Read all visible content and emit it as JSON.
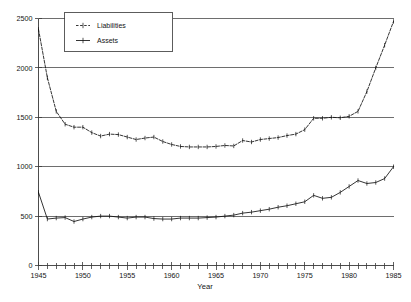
{
  "chart_data": {
    "type": "line",
    "title": "",
    "xlabel": "Year",
    "ylabel": "",
    "xlim": [
      1945,
      1985
    ],
    "ylim": [
      0,
      2500
    ],
    "grid": true,
    "grid_axis": "y",
    "legend_position": "top-left",
    "x_tick_labels": [
      "1945",
      "1950",
      "1955",
      "1960",
      "1965",
      "1970",
      "1975",
      "1980",
      "1985"
    ],
    "x_tick_values": [
      1945,
      1950,
      1955,
      1960,
      1965,
      1970,
      1975,
      1980,
      1985
    ],
    "x_minor_ticks_every": 1,
    "y_tick_labels": [
      "0",
      "500",
      "1000",
      "1500",
      "2000",
      "2500"
    ],
    "y_tick_values": [
      0,
      500,
      1000,
      1500,
      2000,
      2500
    ],
    "x": [
      1945,
      1946,
      1947,
      1948,
      1949,
      1950,
      1951,
      1952,
      1953,
      1954,
      1955,
      1956,
      1957,
      1958,
      1959,
      1960,
      1961,
      1962,
      1963,
      1964,
      1965,
      1966,
      1967,
      1968,
      1969,
      1970,
      1971,
      1972,
      1973,
      1974,
      1975,
      1976,
      1977,
      1978,
      1979,
      1980,
      1981,
      1982,
      1983,
      1984,
      1985
    ],
    "series": [
      {
        "name": "Liabilities",
        "style": "dashed",
        "marker": "plus",
        "color": "#111111",
        "values": [
          2390,
          1900,
          1560,
          1430,
          1400,
          1400,
          1345,
          1310,
          1330,
          1325,
          1300,
          1275,
          1290,
          1300,
          1255,
          1225,
          1205,
          1200,
          1200,
          1200,
          1205,
          1215,
          1210,
          1265,
          1250,
          1275,
          1285,
          1295,
          1315,
          1330,
          1375,
          1490,
          1490,
          1500,
          1495,
          1510,
          1560,
          1760,
          2000,
          2230,
          2470
        ]
      },
      {
        "name": "Assets",
        "style": "solid",
        "marker": "plus",
        "color": "#111111",
        "values": [
          740,
          470,
          480,
          485,
          445,
          470,
          490,
          500,
          500,
          490,
          480,
          490,
          490,
          475,
          470,
          470,
          480,
          480,
          480,
          485,
          490,
          500,
          510,
          530,
          540,
          555,
          570,
          590,
          605,
          625,
          645,
          710,
          680,
          690,
          740,
          800,
          860,
          830,
          840,
          880,
          1000
        ]
      }
    ]
  },
  "legend": {
    "entries": [
      {
        "label": "Liabilities"
      },
      {
        "label": "Assets"
      }
    ]
  },
  "axis": {
    "x_title": "Year"
  }
}
